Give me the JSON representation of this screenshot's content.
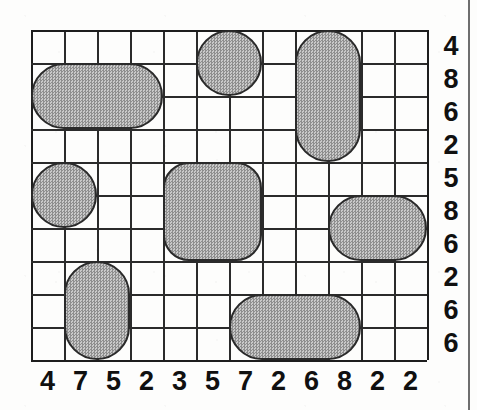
{
  "puzzle": {
    "type": "nonogram-style shaded block grid puzzle",
    "grid": {
      "columns": 12,
      "rows": 10,
      "cell_size_px": 33,
      "origin_px": {
        "x": 31,
        "y": 30
      },
      "line_color": "#2b2b2b"
    },
    "column_clues": [
      "4",
      "7",
      "5",
      "2",
      "3",
      "5",
      "7",
      "2",
      "6",
      "8",
      "2",
      "2"
    ],
    "row_clues": [
      "4",
      "8",
      "6",
      "2",
      "5",
      "8",
      "6",
      "2",
      "6",
      "6"
    ],
    "shape_style": {
      "fill_color": "#a9a9a9",
      "border_color": "#2a2a2a",
      "fill_pattern": "dither-checker"
    },
    "shapes": [
      {
        "name": "circle-top-center",
        "form": "circle",
        "col_start": 6,
        "col_span": 2,
        "row_start": 1,
        "row_span": 2,
        "radius": "50%"
      },
      {
        "name": "rounded-tall-top-right",
        "form": "rounded-vertical-capsule",
        "col_start": 9,
        "col_span": 2,
        "row_start": 1,
        "row_span": 4,
        "radius": "33px"
      },
      {
        "name": "rounded-wide-top-left",
        "form": "rounded-horizontal-capsule",
        "col_start": 1,
        "col_span": 4,
        "row_start": 2,
        "row_span": 2,
        "radius": "33px"
      },
      {
        "name": "circle-mid-left",
        "form": "circle",
        "col_start": 1,
        "col_span": 2,
        "row_start": 5,
        "row_span": 2,
        "radius": "50%"
      },
      {
        "name": "rounded-square-center",
        "form": "rounded-square",
        "col_start": 5,
        "col_span": 3,
        "row_start": 5,
        "row_span": 3,
        "radius": "26px"
      },
      {
        "name": "rounded-wide-mid-right",
        "form": "rounded-horizontal-capsule",
        "col_start": 10,
        "col_span": 3,
        "row_start": 6,
        "row_span": 2,
        "radius": "33px"
      },
      {
        "name": "rounded-tall-bottom-left",
        "form": "rounded-vertical-capsule",
        "col_start": 2,
        "col_span": 2,
        "row_start": 8,
        "row_span": 3,
        "radius": "33px"
      },
      {
        "name": "rounded-wide-bottom-center",
        "form": "rounded-horizontal-capsule",
        "col_start": 7,
        "col_span": 4,
        "row_start": 9,
        "row_span": 2,
        "radius": "33px"
      }
    ]
  }
}
